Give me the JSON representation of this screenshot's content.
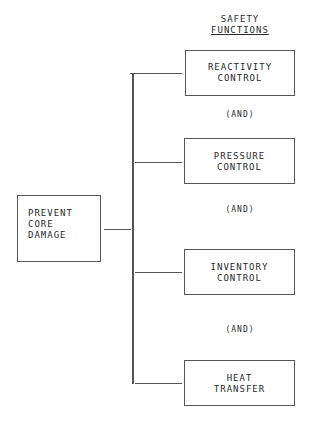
{
  "header": {
    "line1": "SAFETY",
    "line2": "FUNCTIONS"
  },
  "goal": {
    "line1": "PREVENT",
    "line2": "CORE",
    "line3": "DAMAGE"
  },
  "functions": [
    {
      "line1": "REACTIVITY",
      "line2": "CONTROL"
    },
    {
      "line1": "PRESSURE",
      "line2": "CONTROL"
    },
    {
      "line1": "INVENTORY",
      "line2": "CONTROL"
    },
    {
      "line1": "HEAT",
      "line2": "TRANSFER"
    }
  ],
  "connectors": [
    "(AND)",
    "(AND)",
    "(AND)"
  ]
}
